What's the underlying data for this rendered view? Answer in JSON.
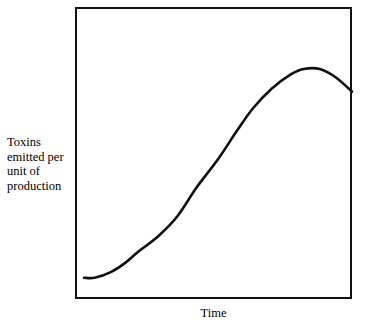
{
  "chart_data": {
    "type": "line",
    "title": "",
    "subtitle": "",
    "xlabel": "Time",
    "ylabel": "Toxins emitted per unit of production",
    "ylabel_lines": [
      "Toxins",
      "emitted per",
      "unit of",
      "production"
    ],
    "grid": false,
    "legend": null,
    "axis_ticks": {
      "x": [],
      "y": []
    },
    "xlim": [
      0,
      100
    ],
    "ylim": [
      0,
      100
    ],
    "annotations": [],
    "series": [
      {
        "name": "Toxins emitted per unit of production",
        "color": "#111111",
        "description": "S-shaped environmental Kuznets style curve: flat at a low level, rising steeply through the middle, peaking near the right, then declining slightly.",
        "x": [
          0,
          4,
          10,
          15,
          20,
          28,
          35,
          42,
          50,
          57,
          63,
          70,
          77,
          82,
          88,
          94,
          100
        ],
        "y": [
          4,
          4,
          6,
          9,
          13,
          19,
          26,
          36,
          46,
          56,
          64,
          71,
          76,
          78,
          78,
          75,
          70
        ]
      }
    ],
    "frame": {
      "border_color": "#111111",
      "background": "#ffffff"
    }
  },
  "axis_labels": {
    "y_text": "Toxins\nemitted per\nunit of\nproduction",
    "x_text": "Time"
  }
}
